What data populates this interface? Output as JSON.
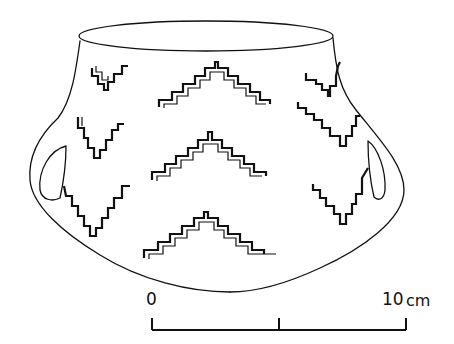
{
  "figure": {
    "ink_color": "#111111",
    "background": "#ffffff"
  },
  "scale_bar": {
    "start_label": "0",
    "end_label": "10",
    "unit": "cm",
    "ticks": [
      0,
      5,
      10
    ]
  }
}
